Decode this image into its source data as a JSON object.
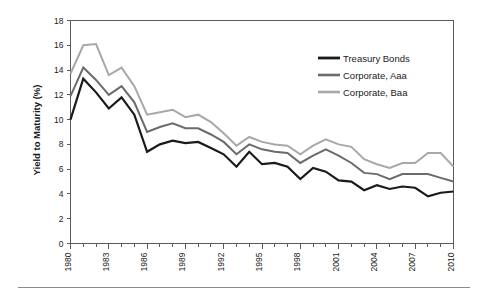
{
  "chart_data": {
    "type": "line",
    "title": "",
    "xlabel": "",
    "ylabel": "Yield to Maturity (%)",
    "xlim": [
      1980,
      2010
    ],
    "ylim": [
      0,
      18
    ],
    "ytick_step": 2,
    "yticks": [
      0,
      2,
      4,
      6,
      8,
      10,
      12,
      14,
      16,
      18
    ],
    "xticks_labeled": [
      1980,
      1983,
      1986,
      1989,
      1992,
      1995,
      1998,
      2001,
      2004,
      2007,
      2010
    ],
    "xtick_minor_step": 1,
    "grid": false,
    "legend_position": "top-right",
    "x": [
      1980,
      1981,
      1982,
      1983,
      1984,
      1985,
      1986,
      1987,
      1988,
      1989,
      1990,
      1991,
      1992,
      1993,
      1994,
      1995,
      1996,
      1997,
      1998,
      1999,
      2000,
      2001,
      2002,
      2003,
      2004,
      2005,
      2006,
      2007,
      2008,
      2009,
      2010
    ],
    "series": [
      {
        "name": "Treasury Bonds",
        "color": "#1a1a1a",
        "width": 2.2,
        "values": [
          10.0,
          13.3,
          12.2,
          10.9,
          11.8,
          10.4,
          7.4,
          8.0,
          8.3,
          8.1,
          8.2,
          7.7,
          7.2,
          6.2,
          7.4,
          6.4,
          6.5,
          6.2,
          5.2,
          6.1,
          5.8,
          5.1,
          5.0,
          4.3,
          4.7,
          4.4,
          4.6,
          4.5,
          3.8,
          4.1,
          4.2
        ]
      },
      {
        "name": "Corporate, Aaa",
        "color": "#6b6b6b",
        "width": 2.0,
        "values": [
          11.9,
          14.2,
          13.2,
          12.0,
          12.7,
          11.4,
          9.0,
          9.4,
          9.7,
          9.3,
          9.3,
          8.8,
          8.2,
          7.2,
          8.0,
          7.6,
          7.4,
          7.3,
          6.5,
          7.1,
          7.6,
          7.1,
          6.5,
          5.7,
          5.6,
          5.2,
          5.6,
          5.6,
          5.6,
          5.3,
          5.0
        ]
      },
      {
        "name": "Corporate, Baa",
        "color": "#a8a8a8",
        "width": 2.0,
        "values": [
          13.7,
          16.0,
          16.1,
          13.6,
          14.2,
          12.7,
          10.4,
          10.6,
          10.8,
          10.2,
          10.4,
          9.8,
          8.9,
          7.9,
          8.6,
          8.2,
          8.0,
          7.9,
          7.2,
          7.9,
          8.4,
          8.0,
          7.8,
          6.8,
          6.4,
          6.1,
          6.5,
          6.5,
          7.3,
          7.3,
          6.2
        ]
      }
    ]
  },
  "legend": {
    "entries": [
      {
        "label": "Treasury Bonds"
      },
      {
        "label": "Corporate, Aaa"
      },
      {
        "label": "Corporate, Baa"
      }
    ]
  }
}
